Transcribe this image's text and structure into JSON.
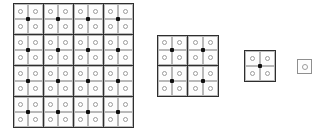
{
  "figure": {
    "type": "multi-resolution-grid-pyramid",
    "background_color": "#ffffff",
    "canvas": {
      "width": 329,
      "height": 130
    },
    "colors": {
      "block_border": "#2e2e2e",
      "cell_border": "#b9b9b9",
      "ring_stroke": "#9b9b9b",
      "center_dot": "#111111",
      "cell_fill": "#fdfdfd"
    },
    "legend": {
      "ring_meaning": "open circle marker at cell center",
      "dot_meaning": "filled square dot at block center"
    }
  },
  "levels": [
    {
      "id": "level-1",
      "label": "level-1",
      "blocks_x": 4,
      "blocks_y": 4,
      "cells_x": 8,
      "cells_y": 8,
      "block_count": 16,
      "cell_count": 64,
      "dot_count": 16,
      "ring_count": 64,
      "x": 13,
      "y": 3,
      "width": 120,
      "height": 124,
      "block_size": 30
    },
    {
      "id": "level-2",
      "label": "level-2",
      "blocks_x": 2,
      "blocks_y": 2,
      "cells_x": 4,
      "cells_y": 4,
      "block_count": 4,
      "cell_count": 16,
      "dot_count": 4,
      "ring_count": 16,
      "x": 157,
      "y": 35,
      "width": 61,
      "height": 61,
      "block_size": 30
    },
    {
      "id": "level-3",
      "label": "level-3",
      "blocks_x": 1,
      "blocks_y": 1,
      "cells_x": 2,
      "cells_y": 2,
      "block_count": 1,
      "cell_count": 4,
      "dot_count": 1,
      "ring_count": 4,
      "x": 244,
      "y": 50,
      "width": 31,
      "height": 31,
      "block_size": 30
    },
    {
      "id": "level-4",
      "label": "level-4",
      "blocks_x": 0,
      "blocks_y": 0,
      "cells_x": 1,
      "cells_y": 1,
      "block_count": 0,
      "cell_count": 1,
      "dot_count": 0,
      "ring_count": 1,
      "x": 297,
      "y": 59,
      "width": 15,
      "height": 15,
      "block_size": 15
    }
  ]
}
